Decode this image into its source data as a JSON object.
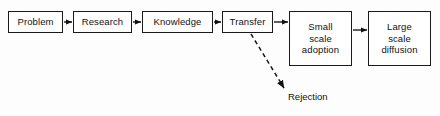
{
  "diagram": {
    "background_color": "#fdfdfd",
    "line_color": "#1a1a1a",
    "text_color": "#111111",
    "nodes": [
      {
        "id": "problem",
        "label": "Problem",
        "x": 8,
        "y": 11,
        "w": 55,
        "h": 22
      },
      {
        "id": "research",
        "label": "Research",
        "x": 73,
        "y": 11,
        "w": 59,
        "h": 22
      },
      {
        "id": "knowledge",
        "label": "Knowledge",
        "x": 142,
        "y": 11,
        "w": 71,
        "h": 22
      },
      {
        "id": "transfer",
        "label": "Transfer",
        "x": 222,
        "y": 11,
        "w": 51,
        "h": 22
      },
      {
        "id": "small",
        "label": "Small\nscale\nadoption",
        "x": 289,
        "y": 11,
        "w": 63,
        "h": 55
      },
      {
        "id": "large",
        "label": "Large\nscale\ndiffusion",
        "x": 368,
        "y": 11,
        "w": 63,
        "h": 55
      }
    ],
    "edges": [
      {
        "id": "problem-research",
        "from": "problem",
        "to": "research",
        "style": "solid",
        "x1": 64,
        "y1": 22,
        "x2": 72,
        "y2": 22
      },
      {
        "id": "research-knowledge",
        "from": "research",
        "to": "knowledge",
        "style": "solid",
        "x1": 133,
        "y1": 22,
        "x2": 141,
        "y2": 22
      },
      {
        "id": "knowledge-transfer",
        "from": "knowledge",
        "to": "transfer",
        "style": "solid",
        "x1": 214,
        "y1": 22,
        "x2": 221,
        "y2": 22
      },
      {
        "id": "transfer-small",
        "from": "transfer",
        "to": "small",
        "style": "solid",
        "x1": 274,
        "y1": 22,
        "x2": 288,
        "y2": 22
      },
      {
        "id": "small-large",
        "from": "small",
        "to": "large",
        "style": "solid",
        "x1": 353,
        "y1": 30,
        "x2": 367,
        "y2": 30
      },
      {
        "id": "transfer-rejection",
        "from": "transfer",
        "to": "rejection",
        "style": "dashed",
        "x1": 251,
        "y1": 34,
        "x2": 284,
        "y2": 88
      }
    ],
    "labels": [
      {
        "id": "rejection",
        "text": "Rejection",
        "x": 288,
        "y": 91
      }
    ]
  }
}
